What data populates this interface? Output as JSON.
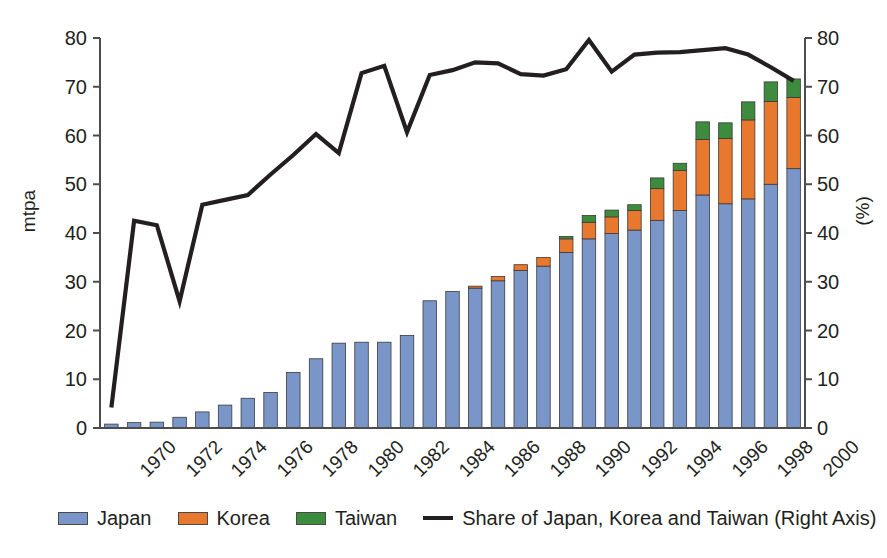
{
  "chart_data": {
    "type": "bar",
    "subtype": "stacked-bar-with-line",
    "title": "",
    "xlabel": "",
    "ylabel": "mtpa",
    "ylabel_right": "(%)",
    "ylim": [
      0,
      80
    ],
    "ylim_right": [
      0,
      80
    ],
    "yticks": [
      0,
      10,
      20,
      30,
      40,
      50,
      60,
      70,
      80
    ],
    "yticks_right": [
      0,
      10,
      20,
      30,
      40,
      50,
      60,
      70,
      80
    ],
    "grid": false,
    "legend_position": "bottom",
    "x": [
      1970,
      1971,
      1972,
      1973,
      1974,
      1975,
      1976,
      1977,
      1978,
      1979,
      1980,
      1981,
      1982,
      1983,
      1984,
      1985,
      1986,
      1987,
      1988,
      1989,
      1990,
      1991,
      1992,
      1993,
      1994,
      1995,
      1996,
      1997,
      1998,
      1999,
      2000
    ],
    "xtick_labels": [
      "1970",
      "1972",
      "1974",
      "1976",
      "1978",
      "1980",
      "1982",
      "1984",
      "1986",
      "1988",
      "1990",
      "1992",
      "1994",
      "1996",
      "1998",
      "2000"
    ],
    "xtick_values": [
      1970,
      1972,
      1974,
      1976,
      1978,
      1980,
      1982,
      1984,
      1986,
      1988,
      1990,
      1992,
      1994,
      1996,
      1998,
      2000
    ],
    "series": [
      {
        "name": "Japan",
        "color": "#7a96c8",
        "values": [
          0.8,
          1.1,
          1.2,
          2.2,
          3.3,
          4.7,
          6.1,
          7.3,
          11.4,
          14.2,
          17.4,
          17.6,
          17.6,
          19.0,
          26.1,
          28.0,
          28.7,
          30.2,
          32.3,
          33.2,
          36.0,
          38.8,
          39.9,
          40.6,
          42.6,
          44.6,
          47.8,
          46.0,
          47.0,
          50.0,
          53.2
        ]
      },
      {
        "name": "Korea",
        "color": "#e8782d",
        "values": [
          0,
          0,
          0,
          0,
          0,
          0,
          0,
          0,
          0,
          0,
          0,
          0,
          0,
          0,
          0,
          0,
          0.4,
          0.9,
          1.2,
          1.8,
          2.8,
          3.4,
          3.4,
          4.0,
          6.5,
          8.2,
          11.4,
          13.4,
          16.2,
          17.0,
          14.6
        ]
      },
      {
        "name": "Taiwan",
        "color": "#3d8b3d",
        "values": [
          0,
          0,
          0,
          0,
          0,
          0,
          0,
          0,
          0,
          0,
          0,
          0,
          0,
          0,
          0,
          0,
          0,
          0,
          0,
          0,
          0.5,
          1.4,
          1.4,
          1.2,
          2.2,
          1.5,
          3.6,
          3.2,
          3.7,
          4.0,
          3.8
        ]
      }
    ],
    "line_series": {
      "name": "Share of Japan, Korea and Taiwan (Right Axis)",
      "color": "#231f20",
      "axis": "right",
      "unit": "%",
      "values": [
        4.2,
        42.5,
        41.6,
        26.0,
        45.8,
        46.8,
        47.8,
        52.0,
        56.0,
        60.3,
        56.4,
        72.8,
        74.3,
        60.7,
        72.4,
        73.4,
        75.0,
        74.8,
        72.6,
        72.3,
        73.6,
        79.6,
        73.1,
        76.6,
        77.0,
        77.1,
        77.5,
        77.9,
        76.6,
        74.0,
        71.2
      ]
    }
  },
  "legend": {
    "items": [
      {
        "label": "Japan",
        "type": "swatch",
        "color": "#7a96c8"
      },
      {
        "label": "Korea",
        "type": "swatch",
        "color": "#e8782d"
      },
      {
        "label": "Taiwan",
        "type": "swatch",
        "color": "#3d8b3d"
      },
      {
        "label": "Share of Japan, Korea and Taiwan (Right Axis)",
        "type": "line",
        "color": "#231f20"
      }
    ]
  },
  "axes": {
    "left_title": "mtpa",
    "right_title": "(%)"
  }
}
